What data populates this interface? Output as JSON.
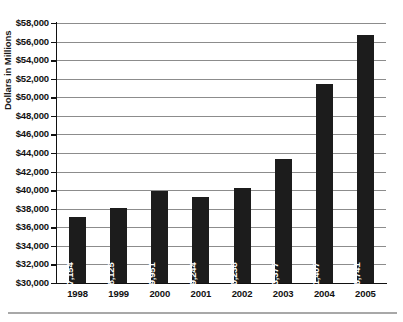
{
  "chart_data": {
    "type": "bar",
    "title": "",
    "subtitle": "",
    "xlabel": "",
    "ylabel": "Dollars in Millions",
    "categories": [
      "1998",
      "1999",
      "2000",
      "2001",
      "2002",
      "2003",
      "2004",
      "2005"
    ],
    "values": [
      37154,
      38125,
      39951,
      39244,
      40238,
      43377,
      51407,
      56741
    ],
    "value_labels": [
      "$37,154",
      "$38,125",
      "$39,951",
      "$39,244",
      "$40,238",
      "$43,377",
      "$51,407",
      "$56,741"
    ],
    "ylim": [
      30000,
      58000
    ],
    "ytick_step": 2000,
    "ytick_labels": [
      "$58,000",
      "$56,000",
      "$54,000",
      "$52,000",
      "$50,000",
      "$48,000",
      "$46,000",
      "$44,000",
      "$42,000",
      "$40,000",
      "$38,000",
      "$36,000",
      "$34,000",
      "$32,000",
      "$30,000"
    ],
    "ytick_values": [
      58000,
      56000,
      54000,
      52000,
      50000,
      48000,
      46000,
      44000,
      42000,
      40000,
      38000,
      36000,
      34000,
      32000,
      30000
    ],
    "grid": true,
    "grid_axis": "y",
    "legend": false,
    "legend_position": "none",
    "orientation": "vertical",
    "bar_color": "#1c1c1c",
    "value_label_color": "#ffffff",
    "value_label_rotation": -90,
    "gridline_color": "#8c8c8c",
    "axis_color": "#111111",
    "background_color": "#ffffff"
  }
}
